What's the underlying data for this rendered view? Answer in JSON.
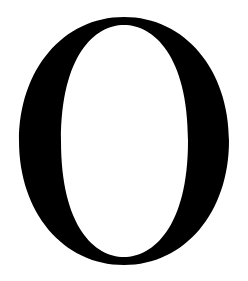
{
  "glyph": {
    "character": "O",
    "fill_color": "#000000",
    "background_color": "#ffffff"
  }
}
